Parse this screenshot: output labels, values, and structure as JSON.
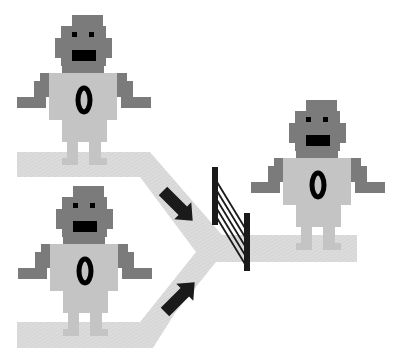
{
  "diagram": {
    "colors": {
      "background": "#ffffff",
      "path": "#dcdcdc",
      "path_hatch": "#cfcfcf",
      "robot_body": "#c4c4c4",
      "robot_head": "#7b7b7b",
      "robot_features": "#000000",
      "arrow": "#1a1a1a",
      "gate": "#1a1a1a"
    },
    "robots": [
      {
        "id": "top-input-robot",
        "label": "0",
        "x": 0,
        "y": 0
      },
      {
        "id": "bottom-input-robot",
        "label": "0",
        "x": 1,
        "y": 171
      },
      {
        "id": "output-robot",
        "label": "0",
        "x": 234,
        "y": 85
      }
    ],
    "arrows": [
      {
        "id": "arrow-top",
        "direction": "down-right"
      },
      {
        "id": "arrow-bottom",
        "direction": "up-right"
      }
    ],
    "gate": {
      "stripes": 5
    }
  }
}
